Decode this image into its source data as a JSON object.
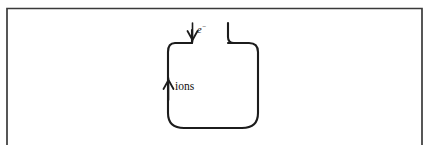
{
  "figure": {
    "background_color": "#ffffff",
    "frame": {
      "name": "figure-border",
      "stroke_color": "#3a3a3a",
      "left": 7,
      "top": 8,
      "right": 422,
      "visible_bottom_cut": true
    },
    "diagram": {
      "title": "ion source chamber",
      "stroke_color": "#1c1c1c",
      "chamber": {
        "name": "ion-source-chamber",
        "shape": "rounded-square",
        "left": 168,
        "top": 43,
        "right": 258,
        "bottom": 128,
        "corner_radius": 22
      },
      "neck": {
        "name": "electron-inlet-neck",
        "left_wall_x": 192,
        "right_wall_x": 228,
        "top_y": 23,
        "bottom_y": 43
      }
    },
    "labels": {
      "electron": {
        "text": "e",
        "superscript": "−",
        "full": "e−",
        "x": 196,
        "y": 33,
        "style": "italic"
      },
      "ions": {
        "text": "ions",
        "x": 174,
        "y": 90,
        "style": "roman"
      }
    },
    "arrows": [
      {
        "name": "electron-inlet-arrow",
        "label": "e−",
        "direction": "down",
        "x": 192,
        "from_y": 23,
        "to_y": 42
      },
      {
        "name": "ion-outlet-arrow",
        "label": "ions",
        "direction": "up",
        "x": 168,
        "from_y": 100,
        "to_y": 78
      }
    ]
  }
}
